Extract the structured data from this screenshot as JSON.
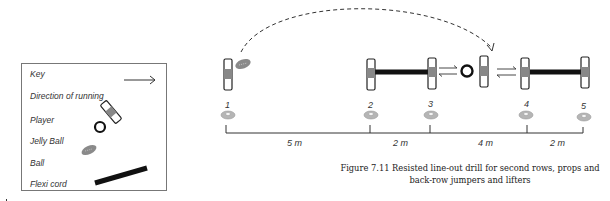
{
  "key": {
    "title": "Key",
    "items": [
      {
        "label": "Direction of running",
        "icon": "arrow-right-icon"
      },
      {
        "label": "Player",
        "icon": "player-icon"
      },
      {
        "label": "Jelly Ball",
        "icon": "jelly-ball-icon"
      },
      {
        "label": "Ball",
        "icon": "rugby-ball-icon"
      },
      {
        "label": "Flexi cord",
        "icon": "flexi-cord-icon"
      }
    ]
  },
  "markers": [
    "1",
    "2",
    "3",
    "4",
    "5"
  ],
  "distances": [
    "5 m",
    "2 m",
    "4 m",
    "2 m"
  ],
  "caption": {
    "line1": "Figure 7.11 Resisted line-out drill for second rows, props and",
    "line2": "back-row jumpers and lifters"
  },
  "colors": {
    "player_outline": "#222222",
    "player_fill": "#8a8a8a",
    "cone": "#b5b5b5",
    "cord": "#111111",
    "line": "#333333"
  }
}
